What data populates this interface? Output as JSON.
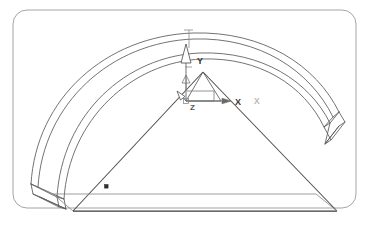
{
  "diagram": {
    "type": "cad-wireframe-3d",
    "background_color": "#ffffff",
    "line_color": "#4a4a4a",
    "line_color_dark": "#2d2d2d",
    "line_color_light": "#8f8f8f",
    "label_color": "#333333",
    "label_color_faint": "#b0b0b0"
  },
  "frame": {
    "name": "viewport-border",
    "x": 13,
    "y": 10,
    "width": 343,
    "height": 198,
    "corner_radius": 14,
    "stroke": "#9a9a9a",
    "stroke_width": 0.9
  },
  "arch": {
    "name": "curved-beam",
    "outer_top_path": "M 31,184 C 38,96 108,37 193,34 C 262,32 315,66 338,113",
    "outer_top_path2": "M 38,186 C 45,101 112,43 194,40 C 259,38 311,71 333,117",
    "inner_arc_path": "M 57,196 C 64,111 128,55 200,52 C 262,50 311,82 331,124",
    "inner_arc_path2": "M 64,198 C 71,117 133,61 202,58 C 260,56 306,86 325,127",
    "left_cap_path": "M 31,184 L 38,186 L 64,198 L 57,196 Z",
    "left_cap_extend": "M 31,184 L 32,193 L 57,206 L 64,198",
    "left_cap_edge2": "M 32,193 L 38,195 L 64,206 L 57,206",
    "right_cap_path": "M 338,113 L 333,117 L 325,127 L 331,124 Z",
    "right_cap_extend": "M 338,113 L 344,122 L 331,137 L 325,127",
    "right_cap_edge2": "M 344,122 L 338,126 L 325,140 L 331,137"
  },
  "triangle": {
    "name": "triangular-section",
    "apex": {
      "x": 203,
      "y": 72
    },
    "left_base": {
      "x": 73,
      "y": 211
    },
    "right_base": {
      "x": 337,
      "y": 211
    },
    "base_plane_path": "M 73,211 L 337,211 L 316,194 L 53,194 Z",
    "apex_small_left": {
      "x": 189,
      "y": 100
    },
    "apex_small_right": {
      "x": 219,
      "y": 100
    },
    "node_marker": {
      "x": 106,
      "y": 186,
      "size": 3
    }
  },
  "axes": {
    "name": "coordinate-triad",
    "origin": {
      "x": 186,
      "y": 101
    },
    "y_axis": {
      "label": "Y",
      "label_x": 197,
      "label_y": 60,
      "tip_x": 186,
      "tip_y": 47,
      "arrow_style": "hollow-triangle"
    },
    "x_axis": {
      "label": "X",
      "label_x": 237,
      "label_y": 104,
      "tip_x": 228,
      "tip_y": 101,
      "arrow_style": "solid-small"
    },
    "x_axis_secondary": {
      "label": "X",
      "label_x": 256,
      "label_y": 103
    },
    "z_axis": {
      "label": "Z",
      "label_x": 193,
      "label_y": 108,
      "tip_x": 181,
      "tip_y": 94,
      "arrow_style": "hollow-triangle"
    },
    "leader_lines": [
      "M 186,47 L 186,101",
      "M 186,101 L 228,101",
      "M 186,101 L 216,101 L 216,90 L 186,90"
    ]
  },
  "dimension_marks": {
    "top_tick": {
      "x": 189,
      "y": 31,
      "length": 8
    },
    "mid_tick": {
      "x": 189,
      "y": 68,
      "length": 6
    }
  }
}
